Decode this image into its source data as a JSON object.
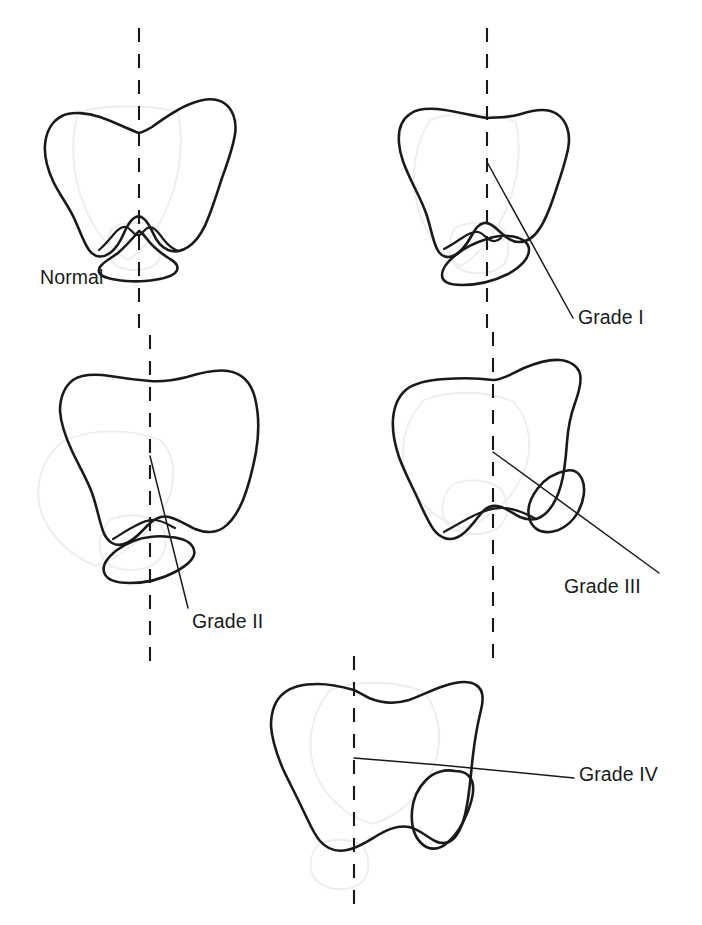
{
  "figure": {
    "background_color": "#ffffff",
    "outline_color": "#1a1a1a",
    "ghost_outline_color": "#ededed"
  },
  "panels": [
    {
      "id": "normal",
      "label": "Normal",
      "axis_x": 139,
      "axis_top": 28,
      "axis_bottom": 330,
      "has_leader_line": false,
      "label_position": {
        "x": 40,
        "y": 268
      }
    },
    {
      "id": "grade-1",
      "label": "Grade I",
      "axis_x": 487,
      "axis_top": 28,
      "axis_bottom": 340,
      "has_leader_line": true,
      "leader_from": {
        "x": 487,
        "y": 162
      },
      "leader_to": {
        "x": 573,
        "y": 318
      },
      "label_position": {
        "x": 578,
        "y": 308
      }
    },
    {
      "id": "grade-2",
      "label": "Grade II",
      "axis_x": 150,
      "axis_top": 335,
      "axis_bottom": 665,
      "has_leader_line": true,
      "leader_from": {
        "x": 150,
        "y": 456
      },
      "leader_to": {
        "x": 188,
        "y": 608
      },
      "label_position": {
        "x": 192,
        "y": 612
      }
    },
    {
      "id": "grade-3",
      "label": "Grade III",
      "axis_x": 493,
      "axis_top": 332,
      "axis_bottom": 665,
      "has_leader_line": true,
      "leader_from": {
        "x": 493,
        "y": 452
      },
      "leader_to": {
        "x": 659,
        "y": 573
      },
      "label_position": {
        "x": 564,
        "y": 577
      }
    },
    {
      "id": "grade-4",
      "label": "Grade IV",
      "axis_x": 354,
      "axis_top": 656,
      "axis_bottom": 905,
      "has_leader_line": true,
      "leader_from": {
        "x": 354,
        "y": 758
      },
      "leader_to": {
        "x": 574,
        "y": 778
      },
      "label_position": {
        "x": 579,
        "y": 765
      }
    }
  ],
  "legend_sequence": [
    "Normal",
    "Grade I",
    "Grade II",
    "Grade III",
    "Grade IV"
  ]
}
